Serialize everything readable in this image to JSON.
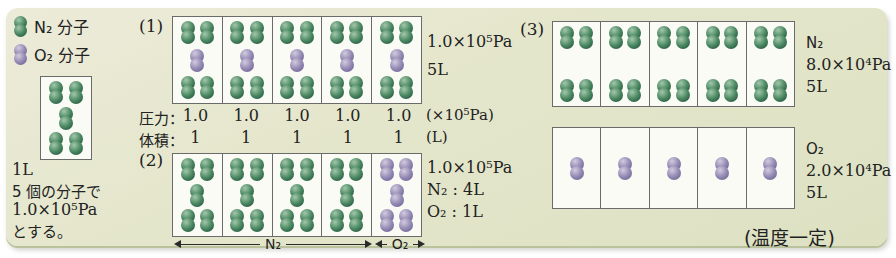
{
  "palette": {
    "card_bg": "#e4e6cb",
    "n2_green": "#4d8a63",
    "o2_purple": "#968cb4",
    "box_border": "#6b6b6b",
    "text": "#222222"
  },
  "legend": {
    "n2_label": "N₂ 分子",
    "o2_label": "O₂ 分子"
  },
  "sample": {
    "box": [
      [
        [
          "n",
          "n"
        ],
        [
          "n"
        ],
        [
          "n",
          "n"
        ]
      ]
    ],
    "volume": "1L",
    "desc1": "5 個の分子で",
    "desc2": "1.0×10⁵Pa",
    "desc3": "とする。"
  },
  "section1": {
    "label": "(1)",
    "boxes": [
      [
        [
          "n",
          "n"
        ],
        [
          "o"
        ],
        [
          "n",
          "n"
        ]
      ],
      [
        [
          "n",
          "n"
        ],
        [
          "o"
        ],
        [
          "n",
          "n"
        ]
      ],
      [
        [
          "n",
          "n"
        ],
        [
          "o"
        ],
        [
          "n",
          "n"
        ]
      ],
      [
        [
          "n",
          "n"
        ],
        [
          "o"
        ],
        [
          "n",
          "n"
        ]
      ],
      [
        [
          "n",
          "n"
        ],
        [
          "o"
        ],
        [
          "n",
          "n"
        ]
      ]
    ],
    "pressure": "1.0×10⁵Pa",
    "volume": "5L",
    "pressure_row": {
      "label": "圧力：",
      "values": [
        "1.0",
        "1.0",
        "1.0",
        "1.0",
        "1.0"
      ],
      "unit": "(×10⁵Pa)"
    },
    "volume_row": {
      "label": "体積：",
      "values": [
        "1",
        "1",
        "1",
        "1",
        "1"
      ],
      "unit": "(L)"
    }
  },
  "section2": {
    "label": "(2)",
    "boxes": [
      [
        [
          "n",
          "n"
        ],
        [
          "n"
        ],
        [
          "n",
          "n"
        ]
      ],
      [
        [
          "n",
          "n"
        ],
        [
          "n"
        ],
        [
          "n",
          "n"
        ]
      ],
      [
        [
          "n",
          "n"
        ],
        [
          "n"
        ],
        [
          "n",
          "n"
        ]
      ],
      [
        [
          "n",
          "n"
        ],
        [
          "n"
        ],
        [
          "n",
          "n"
        ]
      ],
      [
        [
          "o",
          "o"
        ],
        [
          "o"
        ],
        [
          "o",
          "o"
        ]
      ]
    ],
    "pressure": "1.0×10⁵Pa",
    "n2_volume": "N₂ : 4L",
    "o2_volume": "O₂ : 1L",
    "n2_arrow_label": "N₂",
    "o2_arrow_label": "O₂"
  },
  "section3": {
    "label": "(3)",
    "n2_boxes": [
      [
        [
          "n",
          "n"
        ],
        [
          "n",
          "n"
        ]
      ],
      [
        [
          "n",
          "n"
        ],
        [
          "n",
          "n"
        ]
      ],
      [
        [
          "n",
          "n"
        ],
        [
          "n",
          "n"
        ]
      ],
      [
        [
          "n",
          "n"
        ],
        [
          "n",
          "n"
        ]
      ],
      [
        [
          "n",
          "n"
        ],
        [
          "n",
          "n"
        ]
      ]
    ],
    "o2_boxes": [
      [
        [
          "o"
        ]
      ],
      [
        [
          "o"
        ]
      ],
      [
        [
          "o"
        ]
      ],
      [
        [
          "o"
        ]
      ],
      [
        [
          "o"
        ]
      ]
    ],
    "n2_info": {
      "gas": "N₂",
      "pressure": "8.0×10⁴Pa",
      "volume": "5L"
    },
    "o2_info": {
      "gas": "O₂",
      "pressure": "2.0×10⁴Pa",
      "volume": "5L"
    },
    "note": "(温度一定)"
  }
}
